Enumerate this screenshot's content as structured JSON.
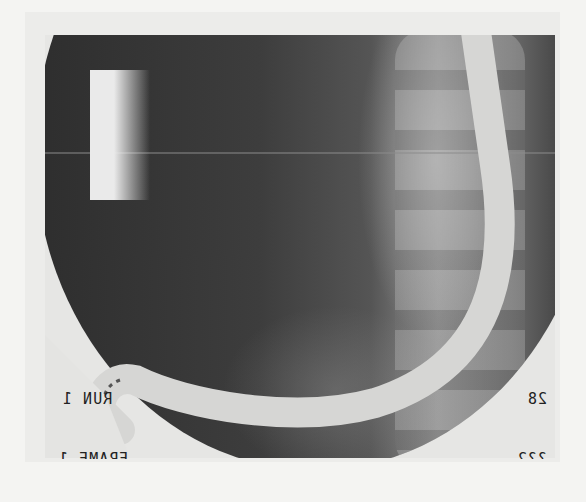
{
  "image": {
    "description": "Fluoroscopic X-ray image showing an endoscope looped in the abdomen with vertebral column visible on the right",
    "overlay_text": {
      "run": "RUN 1",
      "frame": "FRAME 1",
      "number_right": "28",
      "number_right_bottom": "??2"
    },
    "colors": {
      "background": "#f4f4f2",
      "dark_field": "#2e2e2e",
      "scope": "#d8d8d6"
    }
  }
}
